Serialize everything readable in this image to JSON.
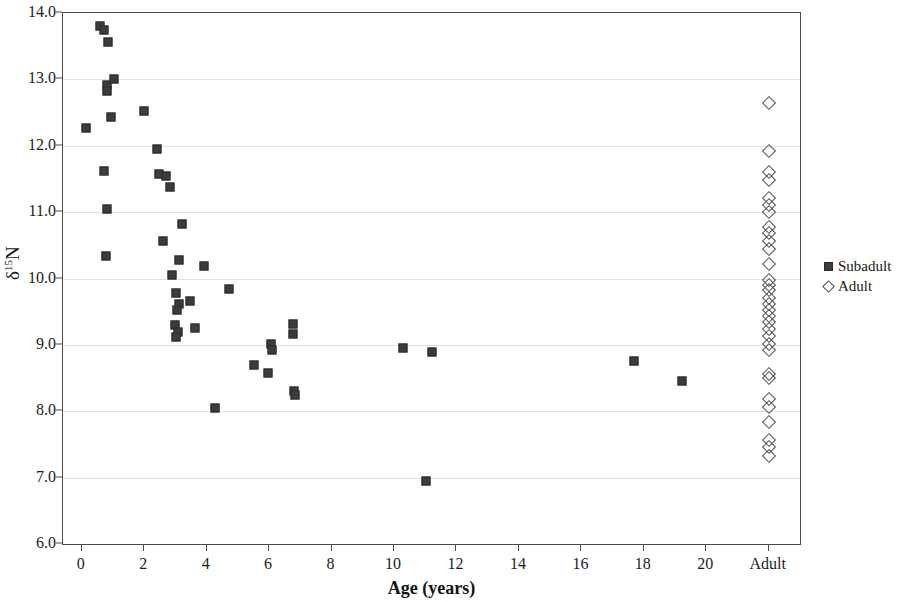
{
  "chart_data": {
    "type": "scatter",
    "title": "",
    "xlabel": "Age (years)",
    "ylabel": "δ¹⁵N",
    "ylabel_base": "δ",
    "ylabel_sup": "15",
    "ylabel_tail": "N",
    "ylim": [
      6.0,
      14.0
    ],
    "ytick_labels": [
      "6.0",
      "7.0",
      "8.0",
      "9.0",
      "10.0",
      "11.0",
      "12.0",
      "13.0",
      "14.0"
    ],
    "ytick_values": [
      6.0,
      7.0,
      8.0,
      9.0,
      10.0,
      11.0,
      12.0,
      13.0,
      14.0
    ],
    "xlim": [
      -0.6,
      23.0
    ],
    "xtick_labels": [
      "0",
      "2",
      "4",
      "6",
      "8",
      "10",
      "12",
      "14",
      "16",
      "18",
      "20",
      "Adult"
    ],
    "xtick_values": [
      0,
      2,
      4,
      6,
      8,
      10,
      12,
      14,
      16,
      18,
      20,
      22
    ],
    "grid": "horizontal",
    "legend_position": "right",
    "series": [
      {
        "name": "Subadult",
        "marker": "filled-square",
        "color": "#3c3c3c",
        "points": [
          [
            0.15,
            12.26
          ],
          [
            0.6,
            13.8
          ],
          [
            0.72,
            13.75
          ],
          [
            0.85,
            13.56
          ],
          [
            0.82,
            12.92
          ],
          [
            0.8,
            12.83
          ],
          [
            1.02,
            13.0
          ],
          [
            0.95,
            12.44
          ],
          [
            0.72,
            11.62
          ],
          [
            0.8,
            11.04
          ],
          [
            0.78,
            10.34
          ],
          [
            2.0,
            12.52
          ],
          [
            2.48,
            11.58
          ],
          [
            2.7,
            11.55
          ],
          [
            2.42,
            11.95
          ],
          [
            2.82,
            11.38
          ],
          [
            2.6,
            10.56
          ],
          [
            2.88,
            10.05
          ],
          [
            3.22,
            10.82
          ],
          [
            3.1,
            10.28
          ],
          [
            3.02,
            9.78
          ],
          [
            3.12,
            9.62
          ],
          [
            3.05,
            9.52
          ],
          [
            3.0,
            9.3
          ],
          [
            3.08,
            9.2
          ],
          [
            3.02,
            9.12
          ],
          [
            3.48,
            9.66
          ],
          [
            3.62,
            9.26
          ],
          [
            3.9,
            10.19
          ],
          [
            4.28,
            8.05
          ],
          [
            4.72,
            9.84
          ],
          [
            5.52,
            8.7
          ],
          [
            5.95,
            8.58
          ],
          [
            6.05,
            9.02
          ],
          [
            6.08,
            8.92
          ],
          [
            6.75,
            9.31
          ],
          [
            6.78,
            9.16
          ],
          [
            6.8,
            8.3
          ],
          [
            6.82,
            8.24
          ],
          [
            10.3,
            8.95
          ],
          [
            11.2,
            8.9
          ],
          [
            11.02,
            6.95
          ],
          [
            17.7,
            8.75
          ],
          [
            19.22,
            8.45
          ]
        ]
      },
      {
        "name": "Adult",
        "marker": "open-diamond",
        "color": "#4a4a4a",
        "x_category": "Adult",
        "values": [
          12.64,
          11.92,
          11.6,
          11.48,
          11.22,
          11.1,
          11.0,
          10.78,
          10.68,
          10.56,
          10.44,
          10.22,
          9.98,
          9.9,
          9.82,
          9.7,
          9.62,
          9.52,
          9.44,
          9.34,
          9.24,
          9.14,
          9.02,
          8.92,
          8.56,
          8.5,
          8.18,
          8.06,
          7.84,
          7.56,
          7.46,
          7.32
        ]
      }
    ]
  },
  "legend": {
    "items": [
      {
        "label": "Subadult",
        "marker": "filled-square"
      },
      {
        "label": "Adult",
        "marker": "open-diamond"
      }
    ]
  }
}
